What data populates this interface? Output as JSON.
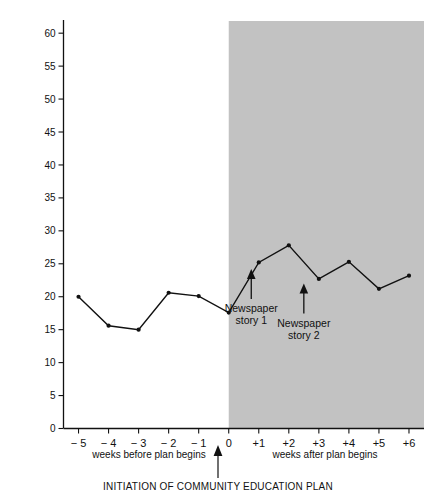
{
  "chart_data": {
    "type": "line",
    "title": "",
    "xlabel": "",
    "ylabel": "REPORTS OF ABUSE OR NEGLECT IN THE COMMUNITY",
    "x": [
      -5,
      -4,
      -3,
      -2,
      -1,
      0,
      1,
      2,
      3,
      4,
      5,
      6
    ],
    "xtick_labels": [
      "− 5",
      "− 4",
      "− 3",
      "− 2",
      "− 1",
      "0",
      "+1",
      "+2",
      "+3",
      "+4",
      "+5",
      "+6"
    ],
    "values": [
      20.0,
      15.6,
      15.0,
      20.6,
      20.1,
      17.6,
      25.2,
      27.8,
      22.7,
      25.3,
      21.2,
      23.2
    ],
    "ytick_labels": [
      "0",
      "5",
      "10",
      "15",
      "20",
      "25",
      "30",
      "35",
      "40",
      "45",
      "50",
      "55",
      "60"
    ],
    "ytick_values": [
      0,
      5,
      10,
      15,
      20,
      25,
      30,
      35,
      40,
      45,
      50,
      55,
      60
    ],
    "ylim": [
      0,
      62
    ],
    "xlim": [
      -5.5,
      6.5
    ],
    "grid": false,
    "legend": "none",
    "series_color": "#111111",
    "shaded_region": {
      "label": "intervention-phase",
      "x_start": 0,
      "x_end": 6.5,
      "color": "#c2c2c2"
    },
    "annotations": [
      {
        "id": "newspaper-story-1",
        "line1": "Newspaper",
        "line2": "story 1",
        "x": 0.75,
        "y": 24.2
      },
      {
        "id": "newspaper-story-2",
        "line1": "Newspaper",
        "line2": "story 2",
        "x": 2.5,
        "y": 22.0
      }
    ]
  },
  "axis_captions": {
    "before": "weeks before plan begins",
    "after": "weeks after plan begins"
  },
  "footer": {
    "caption": "INITIATION OF COMMUNITY EDUCATION PLAN"
  }
}
